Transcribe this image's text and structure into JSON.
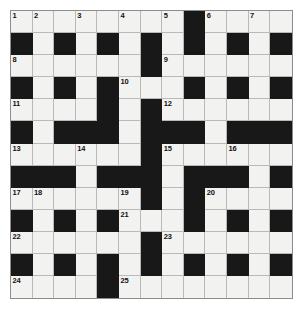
{
  "puzzle": {
    "title": "Crossword Grid",
    "rows": 13,
    "cols": 13,
    "cell_size_px": 21.6,
    "colors": {
      "block": "#181818",
      "cell": "#f2f2f0",
      "grid_line": "#b9b9b9",
      "border": "#8d8d8d",
      "number_text": "#111111",
      "page_background": "#ffffff"
    },
    "numbers_visible": [
      "1",
      "2",
      "3",
      "4",
      "5",
      "6",
      "7",
      "8",
      "9",
      "10",
      "11",
      "12",
      "13",
      "14",
      "15",
      "16",
      "17",
      "18",
      "19",
      "20",
      "21",
      "22",
      "23",
      "24",
      "25"
    ],
    "grid": [
      [
        {
          "block": false,
          "number": "1"
        },
        {
          "block": false,
          "number": "2"
        },
        {
          "block": false,
          "number": ""
        },
        {
          "block": false,
          "number": "3"
        },
        {
          "block": false,
          "number": ""
        },
        {
          "block": false,
          "number": "4"
        },
        {
          "block": false,
          "number": ""
        },
        {
          "block": false,
          "number": "5"
        },
        {
          "block": true,
          "number": ""
        },
        {
          "block": false,
          "number": "6"
        },
        {
          "block": false,
          "number": ""
        },
        {
          "block": false,
          "number": "7"
        },
        {
          "block": false,
          "number": ""
        }
      ],
      [
        {
          "block": true,
          "number": ""
        },
        {
          "block": false,
          "number": ""
        },
        {
          "block": true,
          "number": ""
        },
        {
          "block": false,
          "number": ""
        },
        {
          "block": true,
          "number": ""
        },
        {
          "block": false,
          "number": ""
        },
        {
          "block": true,
          "number": ""
        },
        {
          "block": false,
          "number": ""
        },
        {
          "block": true,
          "number": ""
        },
        {
          "block": false,
          "number": ""
        },
        {
          "block": true,
          "number": ""
        },
        {
          "block": false,
          "number": ""
        },
        {
          "block": true,
          "number": ""
        }
      ],
      [
        {
          "block": false,
          "number": "8"
        },
        {
          "block": false,
          "number": ""
        },
        {
          "block": false,
          "number": ""
        },
        {
          "block": false,
          "number": ""
        },
        {
          "block": false,
          "number": ""
        },
        {
          "block": false,
          "number": ""
        },
        {
          "block": true,
          "number": ""
        },
        {
          "block": false,
          "number": "9"
        },
        {
          "block": false,
          "number": ""
        },
        {
          "block": false,
          "number": ""
        },
        {
          "block": false,
          "number": ""
        },
        {
          "block": false,
          "number": ""
        },
        {
          "block": false,
          "number": ""
        }
      ],
      [
        {
          "block": true,
          "number": ""
        },
        {
          "block": false,
          "number": ""
        },
        {
          "block": true,
          "number": ""
        },
        {
          "block": false,
          "number": ""
        },
        {
          "block": true,
          "number": ""
        },
        {
          "block": false,
          "number": "10"
        },
        {
          "block": false,
          "number": ""
        },
        {
          "block": false,
          "number": ""
        },
        {
          "block": true,
          "number": ""
        },
        {
          "block": false,
          "number": ""
        },
        {
          "block": true,
          "number": ""
        },
        {
          "block": false,
          "number": ""
        },
        {
          "block": true,
          "number": ""
        }
      ],
      [
        {
          "block": false,
          "number": "11"
        },
        {
          "block": false,
          "number": ""
        },
        {
          "block": false,
          "number": ""
        },
        {
          "block": false,
          "number": ""
        },
        {
          "block": true,
          "number": ""
        },
        {
          "block": false,
          "number": ""
        },
        {
          "block": true,
          "number": ""
        },
        {
          "block": false,
          "number": "12"
        },
        {
          "block": false,
          "number": ""
        },
        {
          "block": false,
          "number": ""
        },
        {
          "block": false,
          "number": ""
        },
        {
          "block": false,
          "number": ""
        },
        {
          "block": false,
          "number": ""
        }
      ],
      [
        {
          "block": true,
          "number": ""
        },
        {
          "block": false,
          "number": ""
        },
        {
          "block": true,
          "number": ""
        },
        {
          "block": true,
          "number": ""
        },
        {
          "block": true,
          "number": ""
        },
        {
          "block": false,
          "number": ""
        },
        {
          "block": true,
          "number": ""
        },
        {
          "block": true,
          "number": ""
        },
        {
          "block": true,
          "number": ""
        },
        {
          "block": false,
          "number": ""
        },
        {
          "block": true,
          "number": ""
        },
        {
          "block": true,
          "number": ""
        },
        {
          "block": true,
          "number": ""
        }
      ],
      [
        {
          "block": false,
          "number": "13"
        },
        {
          "block": false,
          "number": ""
        },
        {
          "block": false,
          "number": ""
        },
        {
          "block": false,
          "number": "14"
        },
        {
          "block": false,
          "number": ""
        },
        {
          "block": false,
          "number": ""
        },
        {
          "block": true,
          "number": ""
        },
        {
          "block": false,
          "number": "15"
        },
        {
          "block": false,
          "number": ""
        },
        {
          "block": false,
          "number": ""
        },
        {
          "block": false,
          "number": "16"
        },
        {
          "block": false,
          "number": ""
        },
        {
          "block": false,
          "number": ""
        }
      ],
      [
        {
          "block": true,
          "number": ""
        },
        {
          "block": true,
          "number": ""
        },
        {
          "block": true,
          "number": ""
        },
        {
          "block": false,
          "number": ""
        },
        {
          "block": true,
          "number": ""
        },
        {
          "block": true,
          "number": ""
        },
        {
          "block": true,
          "number": ""
        },
        {
          "block": false,
          "number": ""
        },
        {
          "block": true,
          "number": ""
        },
        {
          "block": true,
          "number": ""
        },
        {
          "block": true,
          "number": ""
        },
        {
          "block": false,
          "number": ""
        },
        {
          "block": true,
          "number": ""
        }
      ],
      [
        {
          "block": false,
          "number": "17"
        },
        {
          "block": false,
          "number": "18"
        },
        {
          "block": false,
          "number": ""
        },
        {
          "block": false,
          "number": ""
        },
        {
          "block": false,
          "number": ""
        },
        {
          "block": false,
          "number": "19"
        },
        {
          "block": true,
          "number": ""
        },
        {
          "block": false,
          "number": ""
        },
        {
          "block": true,
          "number": ""
        },
        {
          "block": false,
          "number": "20"
        },
        {
          "block": false,
          "number": ""
        },
        {
          "block": false,
          "number": ""
        },
        {
          "block": false,
          "number": ""
        }
      ],
      [
        {
          "block": true,
          "number": ""
        },
        {
          "block": false,
          "number": ""
        },
        {
          "block": true,
          "number": ""
        },
        {
          "block": false,
          "number": ""
        },
        {
          "block": true,
          "number": ""
        },
        {
          "block": false,
          "number": "21"
        },
        {
          "block": false,
          "number": ""
        },
        {
          "block": false,
          "number": ""
        },
        {
          "block": true,
          "number": ""
        },
        {
          "block": false,
          "number": ""
        },
        {
          "block": true,
          "number": ""
        },
        {
          "block": false,
          "number": ""
        },
        {
          "block": true,
          "number": ""
        }
      ],
      [
        {
          "block": false,
          "number": "22"
        },
        {
          "block": false,
          "number": ""
        },
        {
          "block": false,
          "number": ""
        },
        {
          "block": false,
          "number": ""
        },
        {
          "block": false,
          "number": ""
        },
        {
          "block": false,
          "number": ""
        },
        {
          "block": true,
          "number": ""
        },
        {
          "block": false,
          "number": "23"
        },
        {
          "block": false,
          "number": ""
        },
        {
          "block": false,
          "number": ""
        },
        {
          "block": false,
          "number": ""
        },
        {
          "block": false,
          "number": ""
        },
        {
          "block": false,
          "number": ""
        }
      ],
      [
        {
          "block": true,
          "number": ""
        },
        {
          "block": false,
          "number": ""
        },
        {
          "block": true,
          "number": ""
        },
        {
          "block": false,
          "number": ""
        },
        {
          "block": true,
          "number": ""
        },
        {
          "block": false,
          "number": ""
        },
        {
          "block": true,
          "number": ""
        },
        {
          "block": false,
          "number": ""
        },
        {
          "block": true,
          "number": ""
        },
        {
          "block": false,
          "number": ""
        },
        {
          "block": true,
          "number": ""
        },
        {
          "block": false,
          "number": ""
        },
        {
          "block": true,
          "number": ""
        }
      ],
      [
        {
          "block": false,
          "number": "24"
        },
        {
          "block": false,
          "number": ""
        },
        {
          "block": false,
          "number": ""
        },
        {
          "block": false,
          "number": ""
        },
        {
          "block": true,
          "number": ""
        },
        {
          "block": false,
          "number": "25"
        },
        {
          "block": false,
          "number": ""
        },
        {
          "block": false,
          "number": ""
        },
        {
          "block": false,
          "number": ""
        },
        {
          "block": false,
          "number": ""
        },
        {
          "block": false,
          "number": ""
        },
        {
          "block": false,
          "number": ""
        },
        {
          "block": false,
          "number": ""
        }
      ]
    ]
  }
}
